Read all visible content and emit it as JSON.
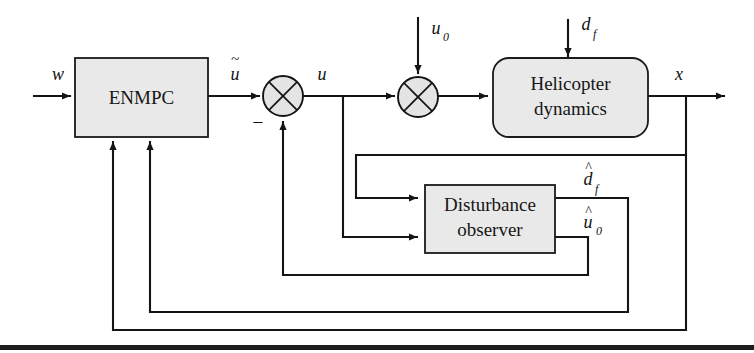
{
  "figure": {
    "type": "control-block-diagram",
    "background_color": "#ffffff",
    "line_color": "#141414",
    "block_fill": "#e9e9e9"
  },
  "blocks": [
    {
      "id": "enmpc",
      "label": "ENMPC",
      "shape": "rectangle",
      "corner": "sharp",
      "x": 75,
      "y": 58,
      "width": 133,
      "height": 79
    },
    {
      "id": "helicopter",
      "label_line1": "Helicopter",
      "label_line2": "dynamics",
      "shape": "rounded-rectangle",
      "corner": "rounded",
      "x": 493,
      "y": 58,
      "width": 155,
      "height": 79
    },
    {
      "id": "observer",
      "label_line1": "Disturbance",
      "label_line2": "observer",
      "shape": "rectangle",
      "corner": "sharp",
      "x": 425,
      "y": 185,
      "width": 130,
      "height": 68
    }
  ],
  "junctions": [
    {
      "id": "sum1",
      "cx": 283,
      "cy": 96,
      "r": 20,
      "style": "circle-with-x",
      "sign": "−"
    },
    {
      "id": "sum2",
      "cx": 418,
      "cy": 97,
      "r": 20,
      "style": "circle-with-x"
    }
  ],
  "signals": {
    "w": "w",
    "u_tilde": "u",
    "u_tilde_accent": "~",
    "u": "u",
    "u0_base": "u",
    "u0_sub": "0",
    "df_base": "d",
    "df_sub": "f",
    "x": "x",
    "df_hat_base": "d",
    "df_hat_sub": "f",
    "u0_hat_base": "u",
    "u0_hat_sub": "0",
    "minus": "−"
  },
  "signal_names": [
    "w",
    "u-tilde",
    "u",
    "u0",
    "df",
    "x",
    "df-hat",
    "u0-hat"
  ]
}
